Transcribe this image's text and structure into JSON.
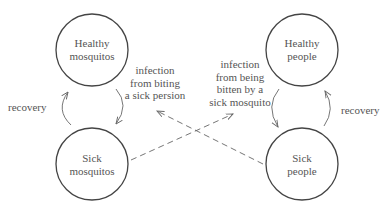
{
  "diagram": {
    "nodes": {
      "healthy_mosquitos": {
        "line1": "Healthy",
        "line2": "mosquitos"
      },
      "sick_mosquitos": {
        "line1": "Sick",
        "line2": "mosquitos"
      },
      "healthy_people": {
        "line1": "Healthy",
        "line2": "people"
      },
      "sick_people": {
        "line1": "Sick",
        "line2": "people"
      }
    },
    "edges": {
      "mosquito_recovery": "recovery",
      "people_recovery": "recovery",
      "mosquito_infection": {
        "line1": "infection",
        "line2": "from biting",
        "line3": "a sick persion"
      },
      "people_infection": {
        "line1": "infection",
        "line2": "from being",
        "line3": "bitten by a",
        "line4": "sick mosquito"
      }
    }
  }
}
